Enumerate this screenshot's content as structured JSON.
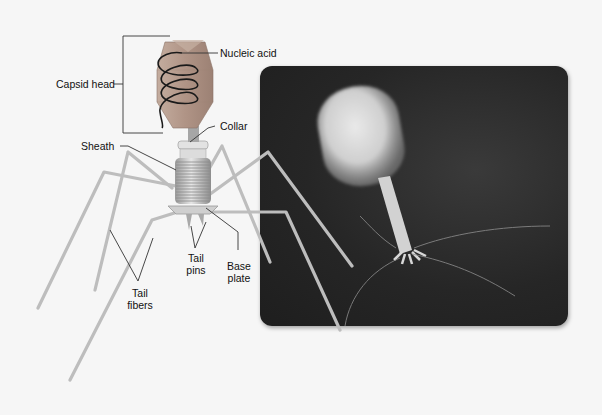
{
  "figure": {
    "type": "bacteriophage-structure",
    "labels": {
      "capsid_head": "Capsid head",
      "nucleic_acid": "Nucleic acid",
      "collar": "Collar",
      "sheath": "Sheath",
      "tail_fibers_line1": "Tail",
      "tail_fibers_line2": "fibers",
      "tail_pins_line1": "Tail",
      "tail_pins_line2": "pins",
      "base_plate_line1": "Base",
      "base_plate_line2": "plate"
    },
    "colors": {
      "background": "#f6f6f6",
      "capsid": "#b39a8e",
      "nucleic_acid": "#1a1a1a",
      "tail": "#c9c9c9",
      "photo_background": "#262626",
      "leader_line": "#333333"
    }
  }
}
